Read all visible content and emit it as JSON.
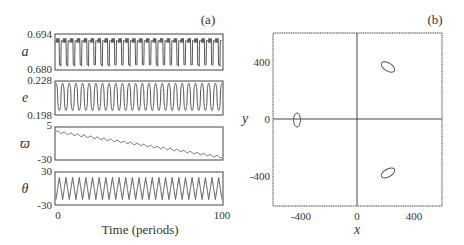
{
  "chart_data": [
    {
      "panel": "(a)",
      "type": "line",
      "xlabel": "Time (periods)",
      "xlim": [
        0,
        100
      ],
      "x_ticks": [
        "0",
        "100"
      ],
      "subplots": [
        {
          "ylabel": "a",
          "ylim": [
            0.68,
            0.694
          ],
          "y_ticks": [
            "0.694",
            "0.680"
          ],
          "description": "periodic oscillation, ~24 cycles, between ~0.6815 and ~0.6915",
          "cycles": 24,
          "min": 0.6815,
          "max": 0.6915
        },
        {
          "ylabel": "e",
          "ylim": [
            0.198,
            0.228
          ],
          "y_ticks": [
            "0.228",
            "0.198"
          ],
          "description": "periodic oscillation, ~25 cycles, between ~0.202 and ~0.226",
          "cycles": 25,
          "min": 0.202,
          "max": 0.226
        },
        {
          "ylabel": "ϖ",
          "ylim": [
            -30,
            5
          ],
          "y_ticks": [
            "5",
            "-30"
          ],
          "description": "linear decline with small wiggles from ~0 at t=0 to ~-27 at t=100",
          "start": 0,
          "end": -27,
          "cycles": 25
        },
        {
          "ylabel": "θ",
          "ylim": [
            -30,
            30
          ],
          "y_ticks": [
            "30",
            "-30"
          ],
          "description": "triangular oscillation, ~25 cycles, amplitude ~±20",
          "cycles": 25,
          "min": -20,
          "max": 20
        }
      ]
    },
    {
      "panel": "(b)",
      "type": "scatter",
      "xlabel": "x",
      "ylabel": "y",
      "xlim": [
        -600,
        600
      ],
      "ylim": [
        -600,
        600
      ],
      "x_ticks": [
        "-400",
        "0",
        "400"
      ],
      "y_ticks": [
        "400",
        "0",
        "-400"
      ],
      "description": "three small closed orbit loops in the x-y plane with crosshair axes through origin",
      "loops": [
        {
          "cx": -430,
          "cy": 0,
          "rx": 12,
          "ry": 38
        },
        {
          "cx": 230,
          "cy": 380,
          "rx": 55,
          "ry": 30,
          "rotate": 30
        },
        {
          "cx": 230,
          "cy": -380,
          "rx": 55,
          "ry": 28,
          "rotate": -30
        }
      ]
    }
  ],
  "labels": {
    "panel_a": "(a)",
    "panel_b": "(b)",
    "a_label": "a",
    "e_label": "e",
    "varpi_label": "ϖ",
    "theta_label": "θ",
    "a_top": "0.694",
    "a_bot": "0.680",
    "e_top": "0.228",
    "e_bot": "0.198",
    "w_top": "5",
    "w_bot": "-30",
    "t_top": "30",
    "t_bot": "-30",
    "time_0": "0",
    "time_100": "100",
    "time_label": "Time (periods)",
    "b_y400": "400",
    "b_y0": "0",
    "b_yn400": "-400",
    "b_xn400": "-400",
    "b_x0": "0",
    "b_x400": "400",
    "b_xlabel": "x",
    "b_ylabel": "y"
  }
}
